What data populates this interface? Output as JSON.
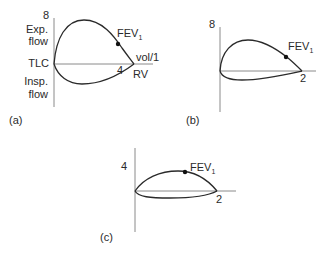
{
  "panels": [
    {
      "id": "a",
      "caption": "(a)",
      "y_max_label": "8",
      "x_tick_label": "4",
      "x_axis_label": "vol/1",
      "upper_label_line1": "Exp.",
      "upper_label_line2": "flow",
      "lower_label_line1": "Insp.",
      "lower_label_line2": "flow",
      "left_point_label": "TLC",
      "right_point_label": "RV",
      "marker_label_main": "FEV",
      "marker_label_sub": "1"
    },
    {
      "id": "b",
      "caption": "(b)",
      "y_max_label": "8",
      "x_tick_label": "2",
      "marker_label_main": "FEV",
      "marker_label_sub": "1"
    },
    {
      "id": "c",
      "caption": "(c)",
      "y_max_label": "4",
      "x_tick_label": "2",
      "marker_label_main": "FEV",
      "marker_label_sub": "1"
    }
  ],
  "colors": {
    "curve": "#2a2a2a",
    "axis": "#8a8a8a",
    "marker": "#111111",
    "text": "#2a2a2a"
  }
}
